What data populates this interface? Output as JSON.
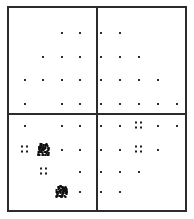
{
  "figure": {
    "width": 194,
    "height": 219,
    "background_color": "#ffffff",
    "frame_color": "#2b2b2b",
    "point_color": "#2e2e2e",
    "cluster_color": "#101010"
  },
  "chart_data": {
    "type": "scatter",
    "title": "",
    "subtitle": "",
    "xlabel": "",
    "ylabel": "",
    "grid": false,
    "legend": null,
    "legend_position": "none",
    "axis_ticks_visible": false,
    "tick_labels_x": [],
    "tick_labels_y": [],
    "xlim": [
      0,
      10
    ],
    "ylim": [
      0,
      8
    ],
    "panels": {
      "rows": 2,
      "cols": 2,
      "divider_x_px": 97,
      "divider_y_px": 114,
      "labels": [
        "top-left",
        "top-right",
        "bottom-left",
        "bottom-right"
      ]
    },
    "column_x_px": [
      25,
      43,
      62,
      80,
      101,
      120,
      139,
      158,
      177
    ],
    "row_y_px": [
      33,
      57,
      80,
      104,
      126,
      150,
      172,
      192
    ],
    "note": "Grid-aligned scatter of small dark markers; several positions carry dense multi-point clusters.",
    "points": [
      {
        "col": 2,
        "row": 0,
        "x_px": 62,
        "y_px": 33,
        "weight": 1,
        "panel": "top-left"
      },
      {
        "col": 3,
        "row": 0,
        "x_px": 80,
        "y_px": 33,
        "weight": 1,
        "panel": "top-left"
      },
      {
        "col": 4,
        "row": 0,
        "x_px": 101,
        "y_px": 33,
        "weight": 1,
        "panel": "top-right"
      },
      {
        "col": 5,
        "row": 0,
        "x_px": 120,
        "y_px": 33,
        "weight": 1,
        "panel": "top-right"
      },
      {
        "col": 1,
        "row": 1,
        "x_px": 43,
        "y_px": 57,
        "weight": 1,
        "panel": "top-left"
      },
      {
        "col": 2,
        "row": 1,
        "x_px": 62,
        "y_px": 57,
        "weight": 1,
        "panel": "top-left"
      },
      {
        "col": 3,
        "row": 1,
        "x_px": 80,
        "y_px": 57,
        "weight": 1,
        "panel": "top-left"
      },
      {
        "col": 4,
        "row": 1,
        "x_px": 101,
        "y_px": 57,
        "weight": 1,
        "panel": "top-right"
      },
      {
        "col": 5,
        "row": 1,
        "x_px": 120,
        "y_px": 57,
        "weight": 1,
        "panel": "top-right"
      },
      {
        "col": 6,
        "row": 1,
        "x_px": 139,
        "y_px": 57,
        "weight": 1,
        "panel": "top-right"
      },
      {
        "col": 0,
        "row": 2,
        "x_px": 25,
        "y_px": 80,
        "weight": 1,
        "panel": "top-left"
      },
      {
        "col": 1,
        "row": 2,
        "x_px": 43,
        "y_px": 80,
        "weight": 1,
        "panel": "top-left"
      },
      {
        "col": 2,
        "row": 2,
        "x_px": 62,
        "y_px": 80,
        "weight": 1,
        "panel": "top-left"
      },
      {
        "col": 3,
        "row": 2,
        "x_px": 80,
        "y_px": 80,
        "weight": 1,
        "panel": "top-left"
      },
      {
        "col": 4,
        "row": 2,
        "x_px": 101,
        "y_px": 80,
        "weight": 1,
        "panel": "top-right"
      },
      {
        "col": 5,
        "row": 2,
        "x_px": 120,
        "y_px": 80,
        "weight": 1,
        "panel": "top-right"
      },
      {
        "col": 6,
        "row": 2,
        "x_px": 139,
        "y_px": 80,
        "weight": 1,
        "panel": "top-right"
      },
      {
        "col": 7,
        "row": 2,
        "x_px": 158,
        "y_px": 80,
        "weight": 1,
        "panel": "top-right"
      },
      {
        "col": 0,
        "row": 3,
        "x_px": 25,
        "y_px": 104,
        "weight": 1,
        "panel": "top-left"
      },
      {
        "col": 2,
        "row": 3,
        "x_px": 62,
        "y_px": 104,
        "weight": 1,
        "panel": "top-left"
      },
      {
        "col": 3,
        "row": 3,
        "x_px": 80,
        "y_px": 104,
        "weight": 1,
        "panel": "top-left"
      },
      {
        "col": 4,
        "row": 3,
        "x_px": 101,
        "y_px": 104,
        "weight": 1,
        "panel": "top-right"
      },
      {
        "col": 5,
        "row": 3,
        "x_px": 120,
        "y_px": 104,
        "weight": 1,
        "panel": "top-right"
      },
      {
        "col": 6,
        "row": 3,
        "x_px": 139,
        "y_px": 104,
        "weight": 1,
        "panel": "top-right"
      },
      {
        "col": 7,
        "row": 3,
        "x_px": 158,
        "y_px": 104,
        "weight": 1,
        "panel": "top-right"
      },
      {
        "col": 8,
        "row": 3,
        "x_px": 177,
        "y_px": 104,
        "weight": 1,
        "panel": "top-right"
      },
      {
        "col": 0,
        "row": 4,
        "x_px": 25,
        "y_px": 126,
        "weight": 1,
        "panel": "bottom-left"
      },
      {
        "col": 2,
        "row": 4,
        "x_px": 62,
        "y_px": 126,
        "weight": 1,
        "panel": "bottom-left"
      },
      {
        "col": 3,
        "row": 4,
        "x_px": 80,
        "y_px": 126,
        "weight": 1,
        "panel": "bottom-left"
      },
      {
        "col": 4,
        "row": 4,
        "x_px": 101,
        "y_px": 126,
        "weight": 1,
        "panel": "bottom-right"
      },
      {
        "col": 5,
        "row": 4,
        "x_px": 120,
        "y_px": 126,
        "weight": 1,
        "panel": "bottom-right"
      },
      {
        "col": 7,
        "row": 4,
        "x_px": 158,
        "y_px": 126,
        "weight": 1,
        "panel": "bottom-right"
      },
      {
        "col": 8,
        "row": 4,
        "x_px": 177,
        "y_px": 126,
        "weight": 1,
        "panel": "bottom-right"
      },
      {
        "col": 2,
        "row": 5,
        "x_px": 62,
        "y_px": 150,
        "weight": 1,
        "panel": "bottom-left"
      },
      {
        "col": 3,
        "row": 5,
        "x_px": 80,
        "y_px": 150,
        "weight": 1,
        "panel": "bottom-left"
      },
      {
        "col": 4,
        "row": 5,
        "x_px": 101,
        "y_px": 150,
        "weight": 1,
        "panel": "bottom-right"
      },
      {
        "col": 5,
        "row": 5,
        "x_px": 120,
        "y_px": 150,
        "weight": 1,
        "panel": "bottom-right"
      },
      {
        "col": 7,
        "row": 5,
        "x_px": 158,
        "y_px": 150,
        "weight": 1,
        "panel": "bottom-right"
      },
      {
        "col": 3,
        "row": 6,
        "x_px": 80,
        "y_px": 172,
        "weight": 1,
        "panel": "bottom-left"
      },
      {
        "col": 4,
        "row": 6,
        "x_px": 101,
        "y_px": 172,
        "weight": 1,
        "panel": "bottom-right"
      },
      {
        "col": 5,
        "row": 6,
        "x_px": 120,
        "y_px": 172,
        "weight": 1,
        "panel": "bottom-right"
      },
      {
        "col": 6,
        "row": 6,
        "x_px": 139,
        "y_px": 172,
        "weight": 1,
        "panel": "bottom-right"
      },
      {
        "col": 3,
        "row": 7,
        "x_px": 80,
        "y_px": 192,
        "weight": 1,
        "panel": "bottom-left"
      },
      {
        "col": 4,
        "row": 7,
        "x_px": 101,
        "y_px": 192,
        "weight": 1,
        "panel": "bottom-right"
      },
      {
        "col": 5,
        "row": 7,
        "x_px": 120,
        "y_px": 192,
        "weight": 1,
        "panel": "bottom-right"
      }
    ],
    "clusters": [
      {
        "x_px": 139,
        "y_px": 126,
        "size": "small",
        "density": "light",
        "panel": "bottom-right"
      },
      {
        "x_px": 25,
        "y_px": 150,
        "size": "small",
        "density": "light",
        "panel": "bottom-left"
      },
      {
        "x_px": 44,
        "y_px": 150,
        "size": "large",
        "density": "dense",
        "panel": "bottom-left"
      },
      {
        "x_px": 139,
        "y_px": 150,
        "size": "small",
        "density": "light",
        "panel": "bottom-right"
      },
      {
        "x_px": 44,
        "y_px": 172,
        "size": "small",
        "density": "light",
        "panel": "bottom-left"
      },
      {
        "x_px": 62,
        "y_px": 192,
        "size": "large",
        "density": "dense",
        "panel": "bottom-left"
      }
    ]
  }
}
